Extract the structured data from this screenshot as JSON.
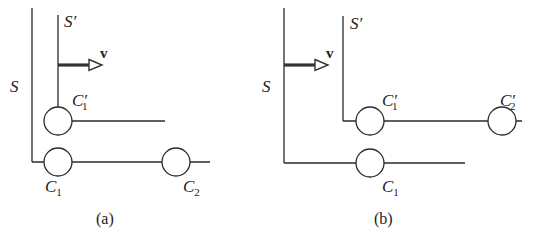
{
  "figure": {
    "panels": [
      {
        "caption": "(a)",
        "frame_S": "S",
        "frame_S_prime": "S′",
        "velocity": "v",
        "clocks": [
          {
            "label": "C",
            "sub": "1",
            "prime": ""
          },
          {
            "label": "C",
            "sub": "1",
            "prime": "′"
          },
          {
            "label": "C",
            "sub": "2",
            "prime": ""
          }
        ]
      },
      {
        "caption": "(b)",
        "frame_S": "S",
        "frame_S_prime": "S′",
        "velocity": "v",
        "clocks": [
          {
            "label": "C",
            "sub": "1",
            "prime": ""
          },
          {
            "label": "C",
            "sub": "1",
            "prime": "′"
          },
          {
            "label": "C",
            "sub": "2",
            "prime": "′"
          }
        ]
      }
    ]
  }
}
